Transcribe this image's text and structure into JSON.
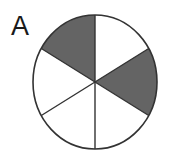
{
  "figure": {
    "label": "A",
    "background_color": "#ffffff",
    "outline_color": "#333333",
    "shaded_color": "#646464",
    "unshaded_color": "#ffffff",
    "divider_color": "#333333"
  },
  "chart_data": {
    "type": "pie",
    "title": "A",
    "xlabel": "",
    "ylabel": "",
    "legend": "none",
    "grid": false,
    "total_sectors": 6,
    "shaded_sectors": 2,
    "fraction_shaded": "2/6",
    "sector_angle_degrees": 60,
    "start_angle_degrees": 0,
    "categories": [
      "sector-1",
      "sector-2",
      "sector-3",
      "sector-4",
      "sector-5",
      "sector-6"
    ],
    "values": [
      1,
      1,
      1,
      1,
      1,
      1
    ],
    "series": [
      {
        "name": "shading",
        "values": [
          0,
          1,
          0,
          0,
          1,
          0
        ]
      }
    ],
    "sectors": [
      {
        "id": "sector-1",
        "start_deg": 0,
        "end_deg": 60,
        "shaded": false,
        "fill": "#ffffff",
        "position": "upper-right"
      },
      {
        "id": "sector-2",
        "start_deg": 60,
        "end_deg": 120,
        "shaded": true,
        "fill": "#646464",
        "position": "right"
      },
      {
        "id": "sector-3",
        "start_deg": 120,
        "end_deg": 180,
        "shaded": false,
        "fill": "#ffffff",
        "position": "lower-right"
      },
      {
        "id": "sector-4",
        "start_deg": 180,
        "end_deg": 240,
        "shaded": false,
        "fill": "#ffffff",
        "position": "lower-left"
      },
      {
        "id": "sector-5",
        "start_deg": 240,
        "end_deg": 300,
        "shaded": false,
        "fill": "#ffffff",
        "position": "left"
      },
      {
        "id": "sector-6",
        "start_deg": 300,
        "end_deg": 360,
        "shaded": true,
        "fill": "#646464",
        "position": "upper-left"
      }
    ],
    "geometry": {
      "center_x": 95,
      "center_y": 82,
      "radius_x": 62,
      "radius_y": 67
    }
  }
}
